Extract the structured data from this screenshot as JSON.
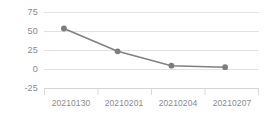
{
  "chart_data": {
    "type": "line",
    "title": "",
    "xlabel": "",
    "ylabel": "",
    "categories": [
      "20210130",
      "20210201",
      "20210204",
      "20210207"
    ],
    "values": [
      54,
      24,
      5,
      3
    ],
    "series": [
      {
        "name": "series-1",
        "values": [
          54,
          24,
          5,
          3
        ]
      }
    ],
    "ylim": [
      -25,
      75
    ],
    "yticks": [
      75,
      50,
      25,
      0,
      -25
    ],
    "ytick_labels": [
      "75",
      "50",
      "25",
      "0",
      "-25"
    ],
    "xtick_labels": [
      "20210130",
      "20210201",
      "20210204",
      "20210207"
    ],
    "grid": true,
    "grid_axis": "y",
    "legend": false,
    "legend_position": "none",
    "marker": "circle",
    "colors": {
      "line": "#808080",
      "marker": "#7d7d7d",
      "grid": "#e2e2e2",
      "axis": "#d5d5d5",
      "text": "#8a8a8a",
      "background": "#ffffff"
    }
  },
  "axis": {
    "y_tick_0": "75",
    "y_tick_1": "50",
    "y_tick_2": "25",
    "y_tick_3": "0",
    "y_tick_4": "-25",
    "x_tick_0": "20210130",
    "x_tick_1": "20210201",
    "x_tick_2": "20210204",
    "x_tick_3": "20210207"
  }
}
